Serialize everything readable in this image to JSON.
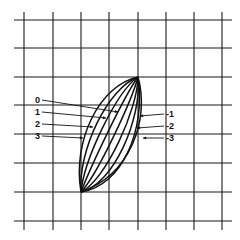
{
  "diagram": {
    "type": "family of curves on grid",
    "grid": {
      "columns": 7,
      "rows": 7
    },
    "curves": [
      {
        "label": "0"
      },
      {
        "label": "1"
      },
      {
        "label": "2"
      },
      {
        "label": "3"
      },
      {
        "label": "-1"
      },
      {
        "label": "-2"
      },
      {
        "label": "-3"
      }
    ],
    "left_labels": [
      "0",
      "1",
      "2",
      "3"
    ],
    "right_labels": [
      "-1",
      "-2",
      "-3"
    ],
    "line_color": "#111111",
    "background": "#ffffff"
  }
}
